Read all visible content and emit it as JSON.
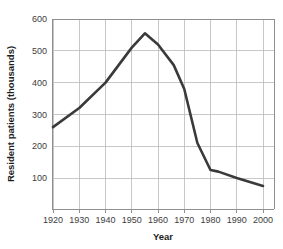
{
  "chart_data": {
    "type": "line",
    "title": "",
    "xlabel": "Year",
    "ylabel": "Resident patients (thousands)",
    "xlim": [
      1915,
      2003
    ],
    "ylim": [
      0,
      630
    ],
    "xticks": [
      1920,
      1930,
      1940,
      1950,
      1960,
      1970,
      1980,
      1990,
      2000
    ],
    "yticks": [
      100,
      200,
      300,
      400,
      500,
      600
    ],
    "grid": true,
    "legend": "none",
    "series": [
      {
        "name": "Resident patients",
        "color": "#3a3a3a",
        "x": [
          1920,
          1930,
          1940,
          1950,
          1955,
          1960,
          1966,
          1970,
          1975,
          1980,
          1983,
          1990,
          2000
        ],
        "values": [
          260,
          320,
          400,
          510,
          555,
          520,
          455,
          380,
          210,
          125,
          120,
          100,
          75
        ]
      }
    ]
  },
  "axes": {
    "x_tick_labels": [
      "1920",
      "1930",
      "1940",
      "1950",
      "1960",
      "1970",
      "1980",
      "1990",
      "2000"
    ],
    "y_tick_labels": [
      "100",
      "200",
      "300",
      "400",
      "500",
      "600"
    ],
    "x_title": "Year",
    "y_title": "Resident patients (thousands)"
  }
}
